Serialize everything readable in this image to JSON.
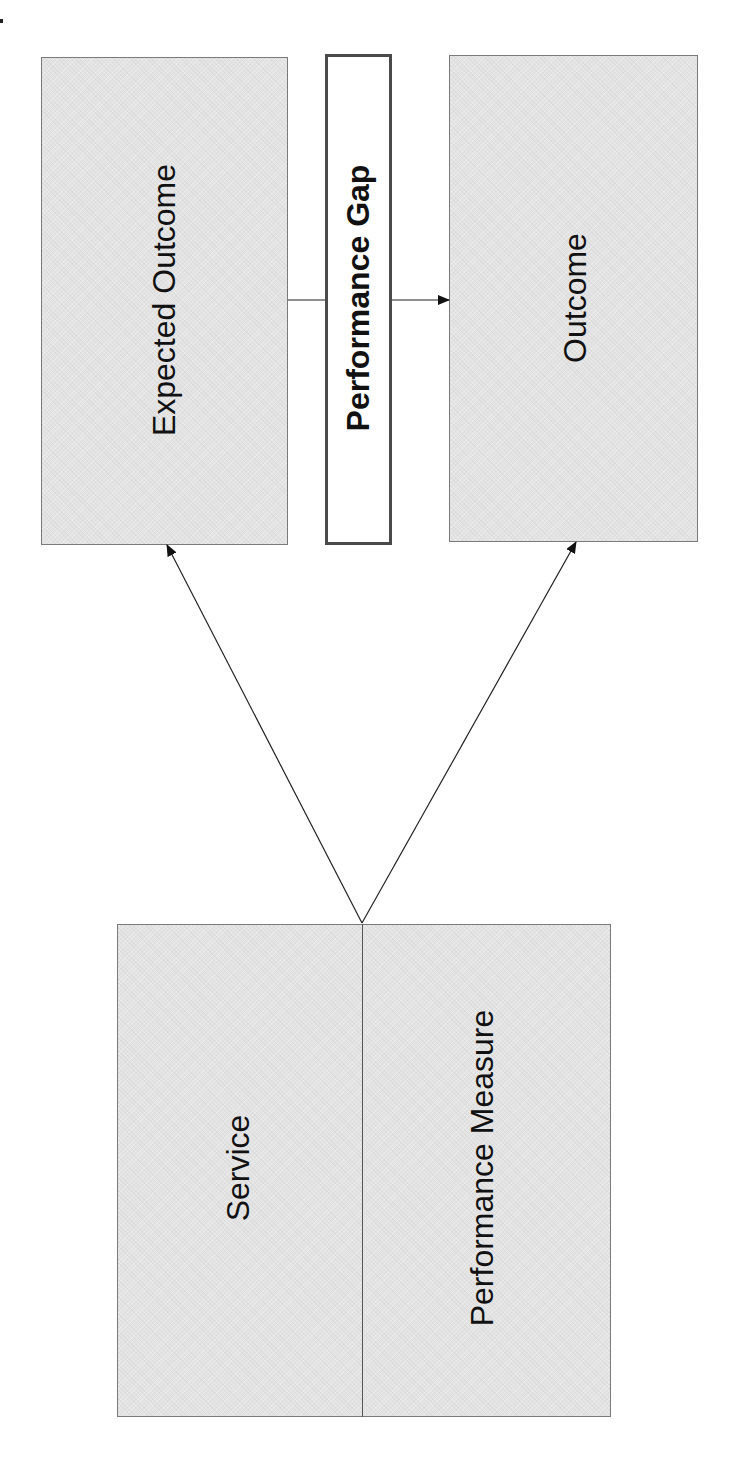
{
  "diagram": {
    "boxes": {
      "expected_outcome": {
        "label": "Expected Outcome"
      },
      "performance_gap": {
        "label": "Performance Gap"
      },
      "outcome": {
        "label": "Outcome"
      },
      "service_measure": {
        "left_label": "Service",
        "right_label": "Performance  Measure"
      }
    },
    "connectors": [
      {
        "from": "Service / Performance Measure",
        "to": "Expected Outcome",
        "type": "arrow"
      },
      {
        "from": "Service / Performance Measure",
        "to": "Outcome",
        "type": "arrow"
      },
      {
        "from": "Expected Outcome",
        "to": "Outcome",
        "via": "Performance Gap",
        "type": "arrow"
      }
    ],
    "colors": {
      "box_fill": "#e3e3e3",
      "box_border": "#7a7a7a",
      "gap_border": "#4a4a4a",
      "line": "#222222"
    }
  }
}
